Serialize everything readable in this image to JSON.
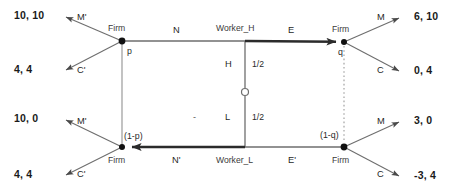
{
  "figure": {
    "kind": "extensive-form-game-tree",
    "background_color": "#ffffff",
    "line_color": "#6e6e6e",
    "bold_line_color": "#2b2b2b",
    "node_color": "#111111",
    "infoset_color": "#8a8a8a"
  },
  "payoffs": {
    "top_left_upper": "10, 10",
    "top_left_lower": "4, 4",
    "bottom_left_upper": "10, 0",
    "bottom_left_lower": "4, 4",
    "top_right_upper": "6, 10",
    "top_right_lower": "0, 4",
    "bottom_right_upper": "3, 0",
    "bottom_right_lower": "-3, 4"
  },
  "players": {
    "firm_top_left": "Firm",
    "firm_bottom_left": "Firm",
    "firm_top_right": "Firm",
    "firm_bottom_right": "Firm",
    "worker_high": "Worker_H",
    "worker_low": "Worker_L"
  },
  "actions": {
    "top_left_up": "M'",
    "top_left_down": "C'",
    "bottom_left_up": "M'",
    "bottom_left_down": "C'",
    "top_middle": "N",
    "bottom_middle": "N'",
    "top_right_in": "E",
    "bottom_right_in": "E'",
    "top_right_up": "M",
    "top_right_down": "C",
    "bottom_right_up": "M",
    "bottom_right_down": "C"
  },
  "beliefs": {
    "left_top": "p",
    "left_bottom": "(1-p)",
    "right_top": "q",
    "right_bottom": "(1-q)"
  },
  "chance": {
    "high_type_label": "H",
    "low_type_label": "L",
    "high_probability": "1/2",
    "low_probability": "1/2",
    "separator_mark": "-"
  }
}
